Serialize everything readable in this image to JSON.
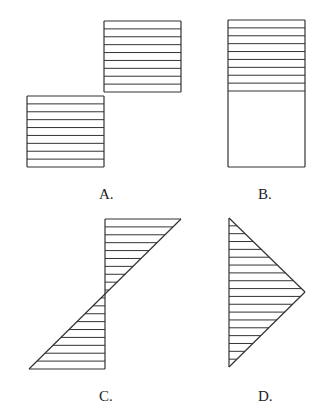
{
  "figures": [
    {
      "id": "A",
      "label": "A.",
      "shape": "two offset hatched rectangles (step)",
      "label_pos": [
        99,
        187
      ]
    },
    {
      "id": "B",
      "label": "B.",
      "shape": "rectangle with upper half hatched",
      "label_pos": [
        258,
        187
      ]
    },
    {
      "id": "C",
      "label": "C.",
      "shape": "two opposite hatched triangles meeting at midpoint",
      "label_pos": [
        99,
        389
      ]
    },
    {
      "id": "D",
      "label": "D.",
      "shape": "hatched triangle pointing right",
      "label_pos": [
        258,
        389
      ]
    }
  ],
  "style": {
    "stroke": "#333333",
    "background": "#ffffff",
    "hatch_spacing": 7.85
  },
  "geometry": {
    "A": {
      "upper_rect": [
        104,
        21,
        181,
        92
      ],
      "lower_rect": [
        27,
        96,
        104,
        167
      ]
    },
    "B": {
      "rect": [
        228,
        20,
        305,
        167
      ],
      "hatch_bottom": 91
    },
    "C": {
      "axis_x": 105,
      "top": 219,
      "bottom": 369,
      "right_x": 181,
      "left_x": 29
    },
    "D": {
      "axis_x": 229,
      "top": 218,
      "bottom": 367,
      "apex": [
        305,
        292
      ]
    }
  }
}
